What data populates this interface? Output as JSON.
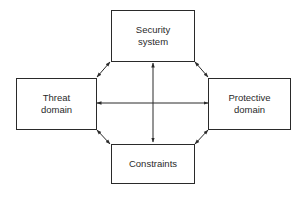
{
  "diagram": {
    "nodes": [
      {
        "id": "security",
        "lines": [
          "Security",
          "system"
        ]
      },
      {
        "id": "threat",
        "lines": [
          "Threat",
          "domain"
        ]
      },
      {
        "id": "protective",
        "lines": [
          "Protective",
          "domain"
        ]
      },
      {
        "id": "constraints",
        "lines": [
          "Constraints"
        ]
      }
    ],
    "edges": [
      {
        "from": "threat",
        "to": "security",
        "type": "bidirectional"
      },
      {
        "from": "security",
        "to": "protective",
        "type": "bidirectional"
      },
      {
        "from": "threat",
        "to": "constraints",
        "type": "bidirectional"
      },
      {
        "from": "protective",
        "to": "constraints",
        "type": "bidirectional"
      },
      {
        "from": "security",
        "to": "constraints",
        "type": "bidirectional"
      },
      {
        "from": "threat",
        "to": "protective",
        "type": "bidirectional"
      }
    ],
    "line_color": "#2a2a2a"
  }
}
